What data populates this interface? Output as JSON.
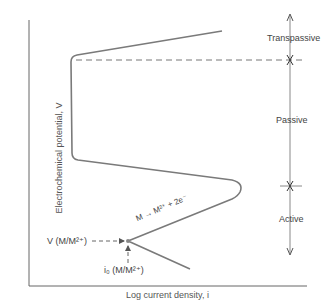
{
  "diagram": {
    "axes": {
      "x_label": "Log current density, i",
      "y_label": "Electrochemical potential, V"
    },
    "regions": [
      {
        "name": "Transpassive",
        "label": "Transpassive"
      },
      {
        "name": "Passive",
        "label": "Passive"
      },
      {
        "name": "Active",
        "label": "Active"
      }
    ],
    "annotations": {
      "reaction": "M → M²⁺ + 2e⁻",
      "equilibrium_potential": "V (M/M²⁺)",
      "exchange_current": "i₀ (M/M²⁺)"
    },
    "colors": {
      "curve": "#7a7a7a",
      "axis": "#666666",
      "text": "#444444"
    }
  }
}
